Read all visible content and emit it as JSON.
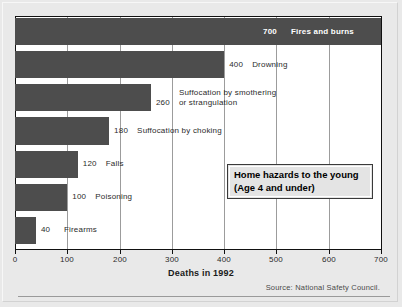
{
  "chart_data": {
    "type": "bar",
    "orientation": "horizontal",
    "title": "Home hazards to the young (Age 4 and under)",
    "title_lines": [
      "Home hazards to the young",
      "(Age 4 and under)"
    ],
    "xlabel": "Deaths in 1992",
    "ylabel": "",
    "xlim": [
      0,
      700
    ],
    "xticks": [
      0,
      100,
      200,
      300,
      400,
      500,
      600,
      700
    ],
    "xtick_labels": [
      "0",
      "100",
      "200",
      "300",
      "400",
      "500",
      "600",
      "700"
    ],
    "grid": "vertical",
    "legend": "none",
    "source": "Source: National Safety Council.",
    "bar_color": "#4d4d4d",
    "categories": [
      "Fires and burns",
      "Drowning",
      "Suffocation by smothering or strangulation",
      "Suffocation by choking",
      "Falls",
      "Poisoning",
      "Firearms"
    ],
    "values": [
      700,
      400,
      260,
      180,
      120,
      100,
      40
    ],
    "bars": [
      {
        "label": "Fires and burns",
        "label_lines": [
          "Fires and burns"
        ],
        "value": 700,
        "value_text": "700",
        "label_inside_bar": true
      },
      {
        "label": "Drowning",
        "label_lines": [
          "Drowning"
        ],
        "value": 400,
        "value_text": "400",
        "label_inside_bar": false
      },
      {
        "label": "Suffocation by smothering or strangulation",
        "label_lines": [
          "Suffocation by smothering",
          "or strangulation"
        ],
        "value": 260,
        "value_text": "260",
        "label_inside_bar": false
      },
      {
        "label": "Suffocation by choking",
        "label_lines": [
          "Suffocation by choking"
        ],
        "value": 180,
        "value_text": "180",
        "label_inside_bar": false
      },
      {
        "label": "Falls",
        "label_lines": [
          "Falls"
        ],
        "value": 120,
        "value_text": "120",
        "label_inside_bar": false
      },
      {
        "label": "Poisoning",
        "label_lines": [
          "Poisoning"
        ],
        "value": 100,
        "value_text": "100",
        "label_inside_bar": false
      },
      {
        "label": "Firearms",
        "label_lines": [
          "Firearms"
        ],
        "value": 40,
        "value_text": "40",
        "label_inside_bar": false
      }
    ]
  }
}
